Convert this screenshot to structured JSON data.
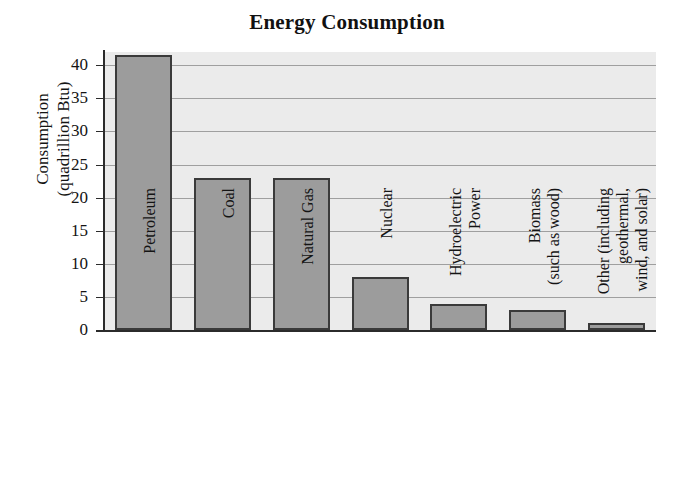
{
  "chart_data": {
    "type": "bar",
    "title": "Energy Consumption",
    "xlabel": "",
    "ylabel": "Consumption (quadrillion Btu)",
    "ylabel_lines": [
      "Consumption",
      "(quadrillion Btu)"
    ],
    "categories": [
      "Petroleum",
      "Coal",
      "Natural Gas",
      "Nuclear",
      "Hydroelectric Power",
      "Biomass (such as wood)",
      "Other (including geothermal, wind, and solar)"
    ],
    "category_lines": [
      [
        "Petroleum"
      ],
      [
        "Coal"
      ],
      [
        "Natural Gas"
      ],
      [
        "Nuclear"
      ],
      [
        "Hydroelectric",
        "Power"
      ],
      [
        "Biomass",
        "(such as wood)"
      ],
      [
        "Other (including",
        "geothermal,",
        "wind, and solar)"
      ]
    ],
    "values": [
      41.5,
      23,
      23,
      8,
      4,
      3,
      1
    ],
    "ylim": [
      0,
      42
    ],
    "yticks": [
      0,
      5,
      10,
      15,
      20,
      25,
      30,
      35,
      40
    ],
    "ytick_labels": [
      "0",
      "5",
      "10",
      "15",
      "20",
      "25",
      "30",
      "35",
      "40"
    ],
    "grid": true,
    "legend": false,
    "colors": {
      "bar_fill": "#9c9c9c",
      "bar_border": "#3a3a3a",
      "plot_background": "#ebebeb",
      "gridline": "#9f9f9f",
      "axis": "#2b2b2b",
      "text": "#141414",
      "page_background": "#ffffff"
    }
  }
}
